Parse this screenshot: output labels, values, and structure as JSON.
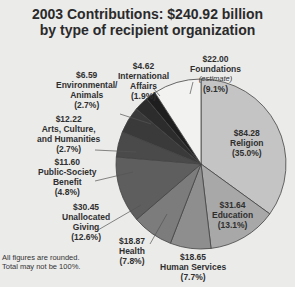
{
  "title": {
    "line1": "2003 Contributions: $240.92 billion",
    "line2": "by type of recipient organization"
  },
  "note": {
    "line1": "All figures are rounded.",
    "line2": "Total may not be 100%."
  },
  "labels": {
    "religion": {
      "amount": "$84.28",
      "name": "Religion",
      "pct": "(35.0%)"
    },
    "education": {
      "amount": "$31.64",
      "name": "Education",
      "pct": "(13.1%)"
    },
    "human_services": {
      "amount": "$18.65",
      "name": "Human Services",
      "pct": "(7.7%)"
    },
    "health": {
      "amount": "$18.87",
      "name": "Health",
      "pct": "(7.8%)"
    },
    "unallocated": {
      "amount": "$30.45",
      "name1": "Unallocated",
      "name2": "Giving",
      "pct": "(12.6%)"
    },
    "public_society": {
      "amount": "$11.60",
      "name1": "Public-Society",
      "name2": "Benefit",
      "pct": "(4.8%)"
    },
    "arts": {
      "amount": "$12.22",
      "name1": "Arts, Culture,",
      "name2": "and Humanities",
      "pct": "(2.7%)"
    },
    "environmental": {
      "amount": "$6.59",
      "name1": "Environmental/",
      "name2": "Animals",
      "pct": "(2.7%)"
    },
    "international": {
      "amount": "$4.62",
      "name1": "International",
      "name2": "Affairs",
      "pct": "(1.9%)"
    },
    "foundations": {
      "amount": "$22.00",
      "name": "Foundations",
      "note": "(estimate)",
      "pct": "(9.1%)"
    }
  },
  "chart_data": {
    "type": "pie",
    "title": "2003 Contributions: $240.92 billion by type of recipient organization",
    "unit": "billion USD",
    "start_angle": "12 o'clock, clockwise",
    "categories": [
      "Religion",
      "Education",
      "Human Services",
      "Health",
      "Unallocated Giving",
      "Public-Society Benefit",
      "Arts, Culture, and Humanities",
      "Environmental/Animals",
      "International Affairs",
      "Foundations (estimate)"
    ],
    "values": [
      84.28,
      31.64,
      18.65,
      18.87,
      30.45,
      11.6,
      12.22,
      6.59,
      4.62,
      22.0
    ],
    "percent_labels": [
      35.0,
      13.1,
      7.7,
      7.8,
      12.6,
      4.8,
      2.7,
      2.7,
      1.9,
      9.1
    ],
    "colors": [
      "#c4c4c4",
      "#a8a8a8",
      "#8e8e8e",
      "#7c7c7c",
      "#5e5e5e",
      "#4a4a4a",
      "#3a3a3a",
      "#2c2c2c",
      "#1e1e1e",
      "#f2f2f0"
    ],
    "annotations": [
      "All figures are rounded.",
      "Total may not be 100%."
    ]
  }
}
